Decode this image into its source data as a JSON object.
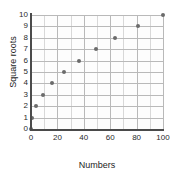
{
  "chart_data": {
    "type": "scatter",
    "title": "",
    "xlabel": "Numbers",
    "ylabel": "Square roots",
    "xlim": [
      0,
      100
    ],
    "ylim": [
      0,
      10
    ],
    "grid": true,
    "legend": null,
    "x_ticks": [
      "0",
      "20",
      "40",
      "60",
      "80",
      "100"
    ],
    "x_tick_values": [
      0,
      20,
      40,
      60,
      80,
      100
    ],
    "y_ticks": [
      "0",
      "1",
      "2",
      "3",
      "4",
      "5",
      "6",
      "7",
      "8",
      "9",
      "10"
    ],
    "y_tick_values": [
      0,
      1,
      2,
      3,
      4,
      5,
      6,
      7,
      8,
      9,
      10
    ],
    "x_minor_step": 10,
    "y_minor_step": 1,
    "series": [
      {
        "name": "square roots",
        "marker_color": "#6b6b6b",
        "points": [
          {
            "x": 0,
            "y": 0
          },
          {
            "x": 1,
            "y": 1
          },
          {
            "x": 4,
            "y": 2
          },
          {
            "x": 9,
            "y": 3
          },
          {
            "x": 16,
            "y": 4
          },
          {
            "x": 25,
            "y": 5
          },
          {
            "x": 36,
            "y": 6
          },
          {
            "x": 49,
            "y": 7
          },
          {
            "x": 64,
            "y": 8
          },
          {
            "x": 81,
            "y": 9
          },
          {
            "x": 100,
            "y": 10
          }
        ]
      }
    ]
  },
  "style": {
    "plot_background": "#fdfdfd",
    "grid_major_color": "#b9b9b9",
    "grid_minor_color": "#d8d8d8",
    "axis_color": "#4a4a4a",
    "text_color": "#1d1d1d"
  }
}
